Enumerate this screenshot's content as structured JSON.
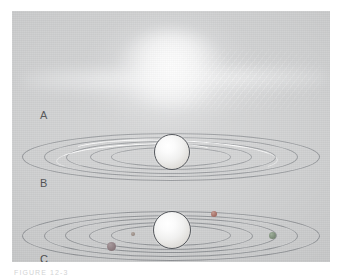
{
  "figure": {
    "caption_fragment": "FIGURE 12-3",
    "background_color": "#c9cacb",
    "plate_color": "#ffffff"
  },
  "panels": [
    {
      "id": "a",
      "label": "A",
      "stage_name": "diffuse-nebula",
      "description": "Diffuse glowing cloud of gas and dust with a flattened disk shape"
    },
    {
      "id": "b",
      "label": "B",
      "stage_name": "ring-system",
      "description": "Central protoplanet surrounded by concentric dust rings with bright arcs"
    },
    {
      "id": "c",
      "label": "C",
      "stage_name": "accreting-planetesimals",
      "description": "Central protoplanet with concentric rings containing condensed planetesimals"
    }
  ],
  "ring_data": {
    "panel_b": {
      "ring_count": 5,
      "rings": [
        {
          "width": 296,
          "height": 46,
          "top": 8
        },
        {
          "width": 252,
          "height": 38,
          "top": 12
        },
        {
          "width": 208,
          "height": 31,
          "top": 16
        },
        {
          "width": 160,
          "height": 24,
          "top": 19
        },
        {
          "width": 118,
          "height": 18,
          "top": 22
        }
      ],
      "arcs": [
        {
          "name": "arc-left",
          "width": 158,
          "height": 24,
          "left": 44,
          "top": 19
        },
        {
          "name": "arc-right",
          "width": 208,
          "height": 31,
          "left": 56,
          "top": 16
        }
      ],
      "planet": {
        "size": 34,
        "left": 142,
        "top": 10
      }
    },
    "panel_c": {
      "ring_count": 5,
      "rings": [
        {
          "width": 296,
          "height": 48,
          "top": 10
        },
        {
          "width": 252,
          "height": 40,
          "top": 14
        },
        {
          "width": 210,
          "height": 33,
          "top": 17
        },
        {
          "width": 162,
          "height": 26,
          "top": 21
        },
        {
          "width": 118,
          "height": 19,
          "top": 24
        }
      ],
      "planet": {
        "size": 36,
        "left": 141,
        "top": 11
      },
      "moons": [
        {
          "name": "moon-upper-right",
          "left": 199,
          "top": 11,
          "size": 6,
          "color": "#a8736a"
        },
        {
          "name": "moon-inner-mid",
          "left": 119,
          "top": 31,
          "size": 4,
          "color": "#9a8d86"
        },
        {
          "name": "moon-right-edge",
          "left": 258,
          "top": 32,
          "size": 7,
          "color": "#7f8f7c"
        },
        {
          "name": "moon-lower-left",
          "left": 96,
          "top": 42,
          "size": 9,
          "color": "#8e7e82"
        }
      ]
    }
  },
  "colors": {
    "background": "#c9cacb",
    "ring_stroke": "#565a60",
    "planet_light": "#ffffff",
    "planet_shadow": "#cfcdc9",
    "label_text": "#3c3d3f",
    "highlight": "#ffffff"
  }
}
